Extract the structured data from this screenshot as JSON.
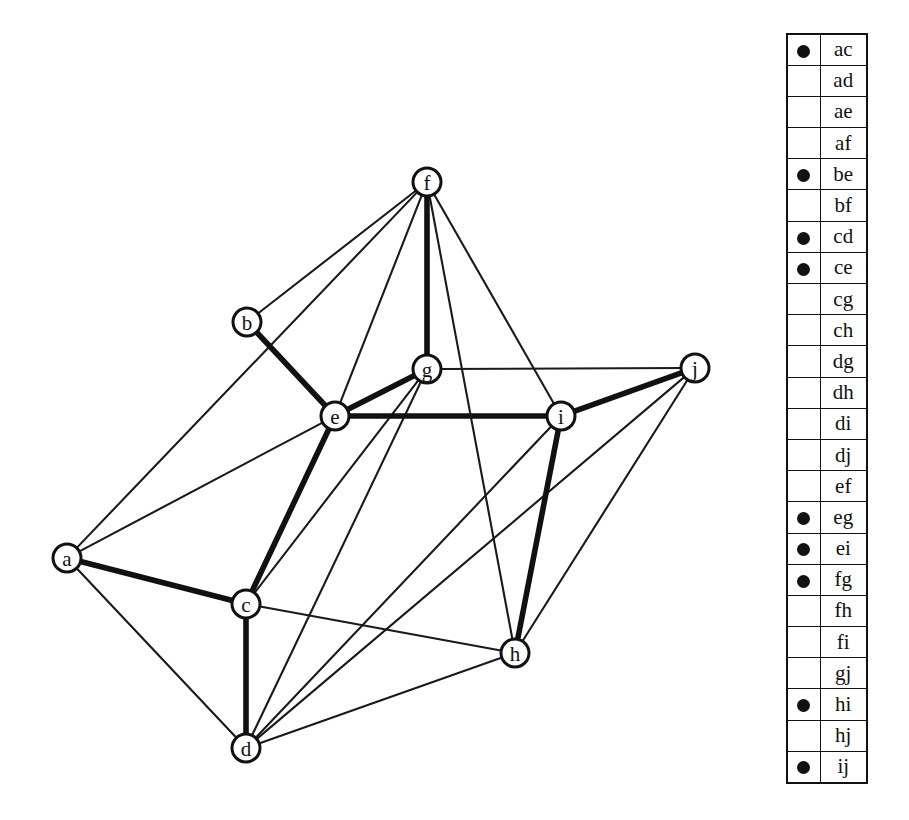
{
  "figure": {
    "kind": "graph-with-edge-legend",
    "background": "#ffffff",
    "ink": "#111111"
  },
  "graph": {
    "nodes": [
      {
        "id": "a",
        "label": "a",
        "x": 67,
        "y": 558
      },
      {
        "id": "b",
        "label": "b",
        "x": 247,
        "y": 322
      },
      {
        "id": "c",
        "label": "c",
        "x": 246,
        "y": 604
      },
      {
        "id": "d",
        "label": "d",
        "x": 246,
        "y": 748
      },
      {
        "id": "e",
        "label": "e",
        "x": 335,
        "y": 416
      },
      {
        "id": "f",
        "label": "f",
        "x": 427,
        "y": 182
      },
      {
        "id": "g",
        "label": "g",
        "x": 427,
        "y": 369
      },
      {
        "id": "h",
        "label": "h",
        "x": 515,
        "y": 653
      },
      {
        "id": "i",
        "label": "i",
        "x": 561,
        "y": 416
      },
      {
        "id": "j",
        "label": "j",
        "x": 695,
        "y": 368
      }
    ],
    "node_radius": 14,
    "edges": [
      {
        "id": "ac",
        "from": "a",
        "to": "c",
        "weight": "thick"
      },
      {
        "id": "ad",
        "from": "a",
        "to": "d",
        "weight": "thin"
      },
      {
        "id": "ae",
        "from": "a",
        "to": "e",
        "weight": "thin"
      },
      {
        "id": "af",
        "from": "a",
        "to": "f",
        "weight": "thin"
      },
      {
        "id": "be",
        "from": "b",
        "to": "e",
        "weight": "thick"
      },
      {
        "id": "bf",
        "from": "b",
        "to": "f",
        "weight": "thin"
      },
      {
        "id": "cd",
        "from": "c",
        "to": "d",
        "weight": "thick"
      },
      {
        "id": "ce",
        "from": "c",
        "to": "e",
        "weight": "thick"
      },
      {
        "id": "cg",
        "from": "c",
        "to": "g",
        "weight": "thin"
      },
      {
        "id": "ch",
        "from": "c",
        "to": "h",
        "weight": "thin"
      },
      {
        "id": "dg",
        "from": "d",
        "to": "g",
        "weight": "thin"
      },
      {
        "id": "dh",
        "from": "d",
        "to": "h",
        "weight": "thin"
      },
      {
        "id": "di",
        "from": "d",
        "to": "i",
        "weight": "thin"
      },
      {
        "id": "dj",
        "from": "d",
        "to": "j",
        "weight": "thin"
      },
      {
        "id": "ef",
        "from": "e",
        "to": "f",
        "weight": "thin"
      },
      {
        "id": "eg",
        "from": "e",
        "to": "g",
        "weight": "thick"
      },
      {
        "id": "ei",
        "from": "e",
        "to": "i",
        "weight": "thick"
      },
      {
        "id": "fg",
        "from": "f",
        "to": "g",
        "weight": "thick"
      },
      {
        "id": "fh",
        "from": "f",
        "to": "h",
        "weight": "thin"
      },
      {
        "id": "fi",
        "from": "f",
        "to": "i",
        "weight": "thin"
      },
      {
        "id": "gj",
        "from": "g",
        "to": "j",
        "weight": "thin"
      },
      {
        "id": "hi",
        "from": "h",
        "to": "i",
        "weight": "thick"
      },
      {
        "id": "hj",
        "from": "h",
        "to": "j",
        "weight": "thin"
      },
      {
        "id": "ij",
        "from": "i",
        "to": "j",
        "weight": "thick"
      }
    ]
  },
  "legend": {
    "rows": [
      {
        "pair": "ac",
        "marked": true
      },
      {
        "pair": "ad",
        "marked": false
      },
      {
        "pair": "ae",
        "marked": false
      },
      {
        "pair": "af",
        "marked": false
      },
      {
        "pair": "be",
        "marked": true
      },
      {
        "pair": "bf",
        "marked": false
      },
      {
        "pair": "cd",
        "marked": true
      },
      {
        "pair": "ce",
        "marked": true
      },
      {
        "pair": "cg",
        "marked": false
      },
      {
        "pair": "ch",
        "marked": false
      },
      {
        "pair": "dg",
        "marked": false
      },
      {
        "pair": "dh",
        "marked": false
      },
      {
        "pair": "di",
        "marked": false
      },
      {
        "pair": "dj",
        "marked": false
      },
      {
        "pair": "ef",
        "marked": false
      },
      {
        "pair": "eg",
        "marked": true
      },
      {
        "pair": "ei",
        "marked": true
      },
      {
        "pair": "fg",
        "marked": true
      },
      {
        "pair": "fh",
        "marked": false
      },
      {
        "pair": "fi",
        "marked": false
      },
      {
        "pair": "gj",
        "marked": false
      },
      {
        "pair": "hi",
        "marked": true
      },
      {
        "pair": "hj",
        "marked": false
      },
      {
        "pair": "ij",
        "marked": true
      }
    ]
  }
}
